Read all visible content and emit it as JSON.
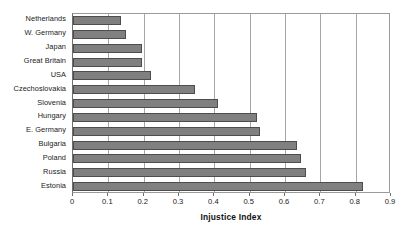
{
  "chart_data": {
    "type": "bar",
    "orientation": "horizontal",
    "title": "",
    "xlabel": "Injustice Index",
    "ylabel": "",
    "xlim": [
      0,
      0.9
    ],
    "xticks": [
      "0",
      "0.1",
      "0.2",
      "0.3",
      "0.4",
      "0.5",
      "0.6",
      "0.7",
      "0.8",
      "0.9"
    ],
    "xtick_values": [
      0,
      0.1,
      0.2,
      0.3,
      0.4,
      0.5,
      0.6,
      0.7,
      0.8,
      0.9
    ],
    "grid": "vertical",
    "legend": "none",
    "categories": [
      "Netherlands",
      "W. Germany",
      "Japan",
      "Great Britain",
      "USA",
      "Czechoslovakia",
      "Slovenia",
      "Hungary",
      "E. Germany",
      "Bulgaria",
      "Poland",
      "Russia",
      "Estonia"
    ],
    "values": [
      0.135,
      0.15,
      0.195,
      0.195,
      0.22,
      0.345,
      0.41,
      0.52,
      0.53,
      0.635,
      0.645,
      0.66,
      0.82
    ],
    "bar_color": "#808080",
    "bar_edge_color": "#4d4d4d",
    "grid_color": "#a6a6a6",
    "frame_color": "#9a9a9a",
    "background_color": "#ffffff"
  }
}
